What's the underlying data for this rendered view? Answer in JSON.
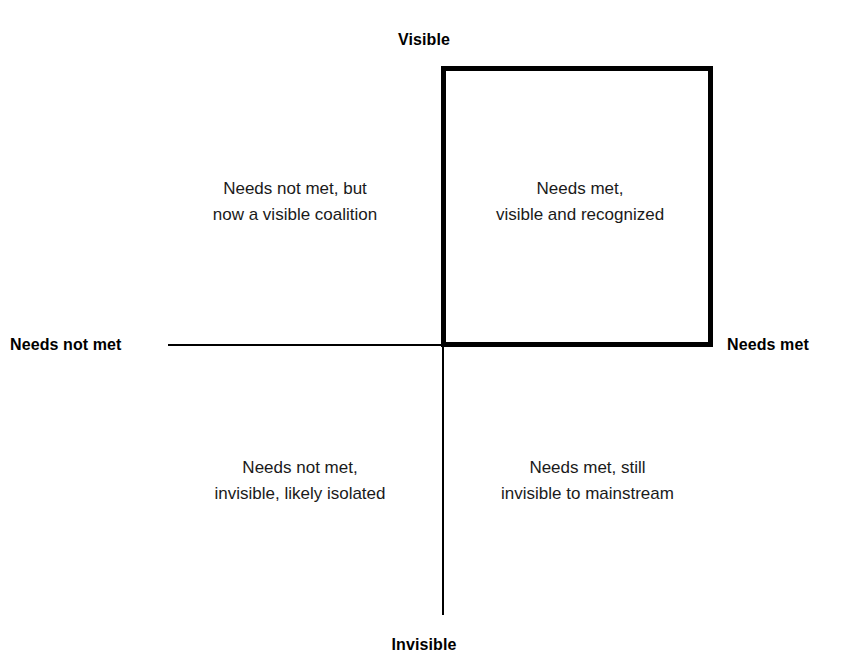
{
  "chart_data": {
    "type": "diagram",
    "subtype": "2x2-quadrant-matrix",
    "title": "",
    "axes": {
      "vertical": {
        "top_label": "Visible",
        "bottom_label": "Invisible"
      },
      "horizontal": {
        "left_label": "Needs not met",
        "right_label": "Needs met"
      }
    },
    "quadrants": [
      {
        "position": "top-left",
        "x": "Needs not met",
        "y": "Visible",
        "lines": [
          "Needs not met, but",
          "now a visible coalition"
        ],
        "highlighted": false
      },
      {
        "position": "top-right",
        "x": "Needs met",
        "y": "Visible",
        "lines": [
          "Needs met,",
          "visible and recognized"
        ],
        "highlighted": true
      },
      {
        "position": "bottom-left",
        "x": "Needs not met",
        "y": "Invisible",
        "lines": [
          "Needs not met,",
          "invisible, likely isolated"
        ],
        "highlighted": false
      },
      {
        "position": "bottom-right",
        "x": "Needs met",
        "y": "Invisible",
        "lines": [
          "Needs met, still",
          "invisible to mainstream"
        ],
        "highlighted": false
      }
    ],
    "highlight": {
      "quadrant": "top-right",
      "style": "thick black rectangle outline",
      "color": "#000000",
      "stroke_width": 5
    },
    "colors": {
      "background": "#ffffff",
      "line": "#000000",
      "text": "#1a1a1a",
      "label": "#000000"
    },
    "grid": false,
    "legend": null
  },
  "axis_labels": {
    "top": "Visible",
    "bottom": "Invisible",
    "left": "Needs not met",
    "right": "Needs met"
  },
  "quadrants": {
    "top_left": {
      "line1": "Needs not met, but",
      "line2": "now a visible coalition"
    },
    "top_right": {
      "line1": "Needs met,",
      "line2": "visible and recognized"
    },
    "bottom_left": {
      "line1": "Needs not met,",
      "line2": "invisible, likely isolated"
    },
    "bottom_right": {
      "line1": "Needs met, still",
      "line2": "invisible to mainstream"
    }
  }
}
